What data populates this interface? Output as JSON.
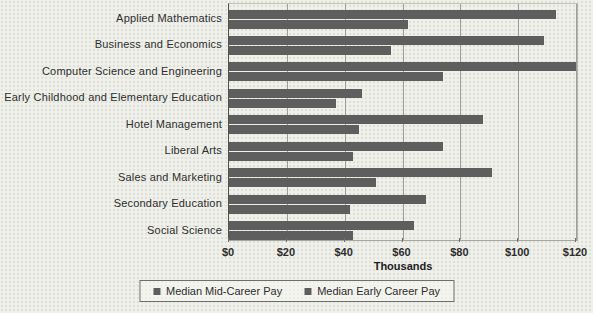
{
  "chart_data": {
    "type": "bar",
    "orientation": "horizontal",
    "title": "",
    "xlabel": "Thousands",
    "ylabel": "",
    "xlim": [
      0,
      120
    ],
    "x_tick_values": [
      0,
      20,
      40,
      60,
      80,
      100,
      120
    ],
    "x_tick_labels": [
      "$0",
      "$20",
      "$40",
      "$60",
      "$80",
      "$100",
      "$120"
    ],
    "grid": true,
    "legend_position": "bottom",
    "bar_color": "#5e5e5e",
    "categories": [
      "Applied Mathematics",
      "Business and Economics",
      "Computer Science and Engineering",
      "Early Childhood and Elementary Education",
      "Hotel Management",
      "Liberal Arts",
      "Sales and Marketing",
      "Secondary Education",
      "Social Science"
    ],
    "series": [
      {
        "name": "Median Mid-Career Pay",
        "values": [
          113,
          109,
          120,
          46,
          88,
          74,
          91,
          68,
          64
        ]
      },
      {
        "name": "Median Early Career Pay",
        "values": [
          62,
          56,
          74,
          37,
          45,
          43,
          51,
          42,
          43
        ]
      }
    ]
  },
  "legend": {
    "items": [
      {
        "label": "Median Mid-Career Pay",
        "marker_color": "#5e5e5e"
      },
      {
        "label": "Median Early Career Pay",
        "marker_color": "#5e5e5e"
      }
    ]
  }
}
